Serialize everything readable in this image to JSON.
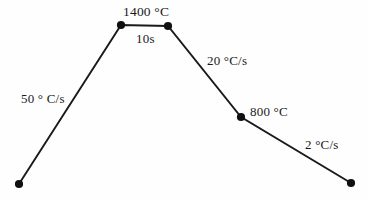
{
  "figure": {
    "type": "thermal-profile-diagram",
    "background_color": "#fefefe",
    "line_color": "#1a1a1a",
    "marker_color": "#101010",
    "width": 369,
    "height": 200
  },
  "labels": {
    "peak_temperature": "1400 °C",
    "hold_time": "10s",
    "heating_rate": "50 ° C/s",
    "cooling_rate_1": "20 °C/s",
    "mid_temperature": "800 °C",
    "cooling_rate_2": "2 °C/s"
  },
  "chart_data": {
    "type": "line",
    "title": "",
    "xlabel": "",
    "ylabel": "",
    "grid": false,
    "legend": null,
    "axis_visible": false,
    "points": [
      {
        "name": "start",
        "x": 19,
        "y": 184,
        "marker": true
      },
      {
        "name": "peak-start",
        "x": 121,
        "y": 25,
        "marker": true
      },
      {
        "name": "peak-end",
        "x": 168,
        "y": 26,
        "marker": true
      },
      {
        "name": "mid-cool",
        "x": 241,
        "y": 117,
        "marker": true
      },
      {
        "name": "end",
        "x": 351,
        "y": 183,
        "marker": true
      }
    ],
    "segments": [
      {
        "from": "start",
        "to": "peak-start",
        "label": "50 ° C/s",
        "role": "heating"
      },
      {
        "from": "peak-start",
        "to": "peak-end",
        "label": "10s",
        "role": "hold"
      },
      {
        "from": "peak-end",
        "to": "mid-cool",
        "label": "20 °C/s",
        "role": "cooling-fast"
      },
      {
        "from": "mid-cool",
        "to": "end",
        "label": "2 °C/s",
        "role": "cooling-slow"
      }
    ],
    "annotations": [
      {
        "text": "1400 °C",
        "at": "peak-start",
        "position": "above"
      },
      {
        "text": "10s",
        "at": "hold-segment",
        "position": "below"
      },
      {
        "text": "50 ° C/s",
        "at": "heating-segment",
        "position": "left"
      },
      {
        "text": "20 °C/s",
        "at": "cooling-fast-segment",
        "position": "right"
      },
      {
        "text": "800 °C",
        "at": "mid-cool",
        "position": "right"
      },
      {
        "text": "2 °C/s",
        "at": "cooling-slow-segment",
        "position": "above-right"
      }
    ]
  }
}
